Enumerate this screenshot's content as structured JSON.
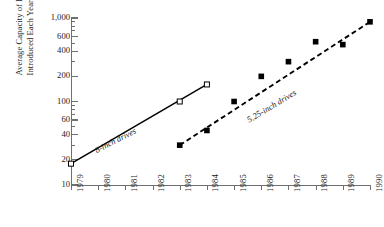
{
  "chart_data": {
    "type": "line",
    "title": "",
    "xlabel": "",
    "ylabel": "Average Capacity of Drives Introduced Each Year (MB)",
    "ylabel_line1": "Average Capacity of Drives",
    "ylabel_line2": "Introduced Each Year (MB)",
    "yscale": "log",
    "ylim": [
      10,
      1000
    ],
    "xlim": [
      1979,
      1990
    ],
    "grid": false,
    "legend_position": "inline-annotations",
    "y_major_ticks": [
      10,
      20,
      40,
      60,
      100,
      200,
      400,
      600,
      1000
    ],
    "y_tick_labels": [
      "10",
      "20",
      "40",
      "60",
      "100",
      "200",
      "400",
      "600",
      "1,000"
    ],
    "y_minor_ticks": [
      30,
      50,
      70,
      80,
      90,
      300,
      500,
      700,
      800,
      900
    ],
    "x_tick_labels": [
      "1979",
      "1980",
      "1981",
      "1982",
      "1983",
      "1984",
      "1985",
      "1986",
      "1987",
      "1988",
      "1989",
      "1990"
    ],
    "series": [
      {
        "name": "8-inch drives",
        "marker": "open-square",
        "linestyle": "solid",
        "color": "#000000",
        "x": [
          1979,
          1983,
          1984
        ],
        "values": [
          18,
          100,
          160
        ]
      },
      {
        "name": "5.25-inch drives",
        "marker": "filled-square",
        "linestyle": "dashed",
        "color": "#000000",
        "x": [
          1983,
          1984,
          1985,
          1986,
          1987,
          1988,
          1989,
          1990
        ],
        "values": [
          30,
          45,
          100,
          200,
          300,
          520,
          480,
          900
        ]
      }
    ],
    "annotations": [
      {
        "text": "8-inch drives",
        "rotation": -27
      },
      {
        "text": "5.25-inch drives",
        "rotation": -31
      }
    ]
  }
}
